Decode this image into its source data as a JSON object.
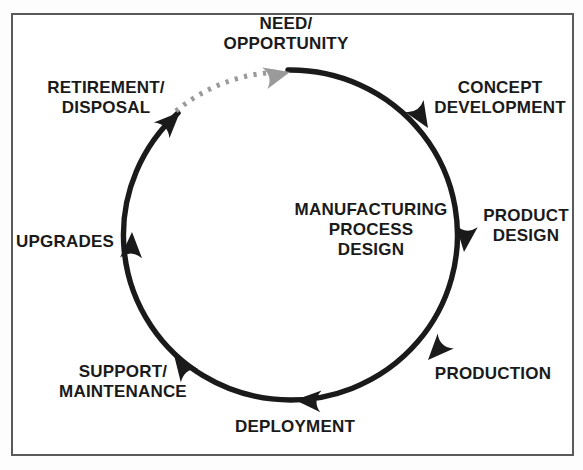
{
  "diagram": {
    "type": "cycle",
    "frame_color": "#5a5a5a",
    "background_color": "#ffffff",
    "arc_color": "#1a1a1a",
    "dotted_arc_color": "#9a9a9a",
    "center_label": "MANUFACTURING\nPROCESS\nDESIGN",
    "nodes": [
      {
        "id": "need-opportunity",
        "label": "NEED/\nOPPORTUNITY",
        "align": "center",
        "angle_deg": 90
      },
      {
        "id": "concept-development",
        "label": "CONCEPT\nDEVELOPMENT",
        "align": "center",
        "angle_deg": 50
      },
      {
        "id": "product-design",
        "label": "PRODUCT\nDESIGN",
        "align": "center",
        "angle_deg": 0
      },
      {
        "id": "production",
        "label": "PRODUCTION",
        "align": "center",
        "angle_deg": -48
      },
      {
        "id": "deployment",
        "label": "DEPLOYMENT",
        "align": "center",
        "angle_deg": -90
      },
      {
        "id": "support-maintenance",
        "label": "SUPPORT/\nMAINTENANCE",
        "align": "center",
        "angle_deg": -130
      },
      {
        "id": "upgrades",
        "label": "UPGRADES",
        "align": "center",
        "angle_deg": 180
      },
      {
        "id": "retirement-disposal",
        "label": "RETIREMENT/\nDISPOSAL",
        "align": "center",
        "angle_deg": 133
      }
    ],
    "arrow_count": 8,
    "dotted_segment": "retirement-disposal to need-opportunity"
  }
}
